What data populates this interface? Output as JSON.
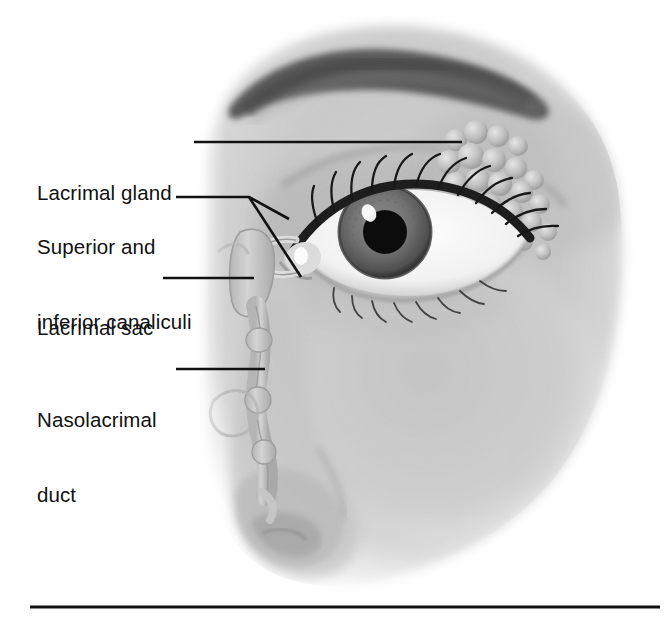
{
  "figure": {
    "kind": "anatomical-illustration",
    "style": "grayscale airbrush medical illustration",
    "background_color": "#ffffff",
    "ink_color": "#111111",
    "canvas": {
      "width": 668,
      "height": 625
    }
  },
  "labels": [
    {
      "id": "lacrimal-gland",
      "text": "Lacrimal gland",
      "lines": [
        "Lacrimal gland"
      ],
      "x": 37,
      "y": 130,
      "leader": {
        "type": "straight",
        "x1": 194,
        "y1": 142,
        "x2": 462,
        "y2": 142
      }
    },
    {
      "id": "canaliculi",
      "text": "Superior and inferior canaliculi",
      "lines": [
        "Superior and",
        "inferior canaliculi"
      ],
      "x": 37,
      "y": 184,
      "leader": {
        "type": "forked",
        "x1": 176,
        "y1": 197,
        "vx": 249,
        "vy": 197,
        "branches": [
          {
            "x": 289,
            "y": 219
          },
          {
            "x": 301,
            "y": 277
          }
        ]
      }
    },
    {
      "id": "lacrimal-sac",
      "text": "Lacrimal sac",
      "lines": [
        "Lacrimal sac"
      ],
      "x": 37,
      "y": 265,
      "leader": {
        "type": "straight",
        "x1": 163,
        "y1": 278,
        "x2": 254,
        "y2": 278
      }
    },
    {
      "id": "nasolacrimal-duct",
      "text": "Nasolacrimal duct",
      "lines": [
        "Nasolacrimal",
        "duct"
      ],
      "x": 37,
      "y": 357,
      "leader": {
        "type": "straight",
        "x1": 176,
        "y1": 369,
        "x2": 265,
        "y2": 369
      }
    }
  ],
  "rule": {
    "x1": 30,
    "y1": 607,
    "x2": 660,
    "y2": 607,
    "thickness": 3,
    "color": "#111111"
  },
  "anatomy": {
    "eye": {
      "iris_center": [
        385,
        232
      ],
      "iris_radius": 46,
      "pupil_radius": 22,
      "highlight": [
        369,
        214
      ]
    },
    "gland_lobules": 22,
    "duct_path": "from lacrimal sac at y=230 down to nasal cavity at y=495"
  }
}
